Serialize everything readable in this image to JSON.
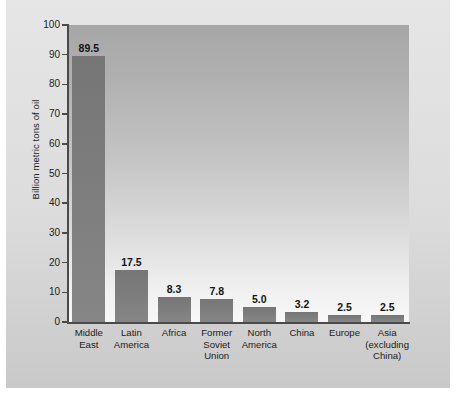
{
  "chart_data": {
    "type": "bar",
    "title": "",
    "xlabel": "",
    "ylabel": "Billion metric tons of oil",
    "ylim": [
      0,
      100
    ],
    "ytick_step": 10,
    "yticks": [
      "100",
      "90",
      "80",
      "70",
      "60",
      "50",
      "40",
      "30",
      "20",
      "10",
      "0"
    ],
    "grid": false,
    "legend": null,
    "categories": [
      "Middle East",
      "Latin America",
      "Africa",
      "Former Soviet Union",
      "North America",
      "China",
      "Europe",
      "Asia (excluding China)"
    ],
    "category_lines": [
      [
        "Middle",
        "East"
      ],
      [
        "Latin",
        "America"
      ],
      [
        "Africa"
      ],
      [
        "Former",
        "Soviet",
        "Union"
      ],
      [
        "North",
        "America"
      ],
      [
        "China"
      ],
      [
        "Europe"
      ],
      [
        "Asia",
        "(excluding",
        "China)"
      ]
    ],
    "values": [
      89.5,
      17.5,
      8.3,
      7.8,
      5.0,
      3.2,
      2.5,
      2.5
    ],
    "value_labels": [
      "89.5",
      "17.5",
      "8.3",
      "7.8",
      "5.0",
      "3.2",
      "2.5",
      "2.5"
    ],
    "colors": {
      "bar": "#7c7c7c",
      "plot_background_top": "#a7a7a7",
      "plot_background_bottom": "#f8f8f8",
      "card_background": "#dcdcdc",
      "axis": "#4a4a4a",
      "text": "#1b1b1b",
      "page_background": "#ffffff"
    }
  }
}
